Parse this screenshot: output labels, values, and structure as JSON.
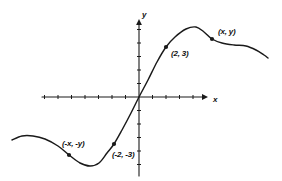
{
  "figure": {
    "background_color": "#ffffff",
    "ink_color": "#1a1a1a",
    "width": 282,
    "height": 181
  },
  "axes": {
    "x_label": "x",
    "y_label": "y",
    "x_label_pos": {
      "x": 213,
      "y": 95
    },
    "y_label_pos": {
      "x": 142,
      "y": 10
    },
    "origin": {
      "x": 139,
      "y": 97
    },
    "x_axis": {
      "x1": 42,
      "x2": 208,
      "y": 97
    },
    "y_axis": {
      "x": 139,
      "y1": 19,
      "y2": 176
    },
    "x_tick_spacing": 13.5,
    "y_tick_spacing": 13.5,
    "tick_len": 4,
    "arrow_x": true,
    "arrow_y": true
  },
  "chart_data": {
    "type": "line",
    "title": "",
    "xlabel": "x",
    "ylabel": "y",
    "grid": false,
    "legend": false,
    "xlim": [
      -9.4,
      9.6
    ],
    "ylim": [
      -5.8,
      5.8
    ],
    "curve_points_px": [
      [
        12,
        140
      ],
      [
        22,
        136
      ],
      [
        33,
        136
      ],
      [
        45,
        139
      ],
      [
        58,
        146
      ],
      [
        69,
        155
      ],
      [
        80,
        163
      ],
      [
        90,
        166
      ],
      [
        99,
        163
      ],
      [
        107,
        153
      ],
      [
        114,
        144
      ],
      [
        122,
        130
      ],
      [
        131,
        113
      ],
      [
        139,
        97
      ],
      [
        148,
        80
      ],
      [
        157,
        62
      ],
      [
        166,
        47
      ],
      [
        175,
        37
      ],
      [
        186,
        29
      ],
      [
        196,
        27
      ],
      [
        204,
        32
      ],
      [
        212,
        39
      ],
      [
        222,
        43
      ],
      [
        234,
        45
      ],
      [
        246,
        46
      ],
      [
        256,
        50
      ],
      [
        264,
        55
      ],
      [
        268,
        58
      ]
    ],
    "points": [
      {
        "id": "p1",
        "label": "(2, 3)",
        "x": 2,
        "y": 3,
        "px": 166,
        "py": 47,
        "label_px": 171,
        "label_py": 49
      },
      {
        "id": "p2",
        "label": "(x, y)",
        "x": "x",
        "y": "y",
        "px": 212,
        "py": 39,
        "label_px": 218,
        "label_py": 27
      },
      {
        "id": "p3",
        "label": "(-x, -y)",
        "x": "-x",
        "y": "-y",
        "px": 69,
        "py": 155,
        "label_px": 62,
        "label_py": 139
      },
      {
        "id": "p4",
        "label": "(-2, -3)",
        "x": -2,
        "y": -3,
        "px": 114,
        "py": 144,
        "label_px": 112,
        "label_py": 150
      }
    ]
  }
}
